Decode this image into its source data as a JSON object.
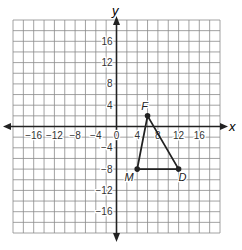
{
  "graph": {
    "x_axis_label": "x",
    "y_axis_label": "y",
    "x_range": [
      -20,
      20
    ],
    "y_range": [
      -20,
      20
    ],
    "grid_step": 2,
    "x_tick_labels": [
      "−16",
      "−12",
      "−8",
      "−4",
      "0",
      "4",
      "8",
      "12",
      "16"
    ],
    "x_tick_values": [
      -16,
      -12,
      -8,
      -4,
      0,
      4,
      8,
      12,
      16
    ],
    "y_tick_labels": [
      "16",
      "12",
      "8",
      "4",
      "−4",
      "−8",
      "−12",
      "−16"
    ],
    "y_tick_values": [
      16,
      12,
      8,
      4,
      -4,
      -8,
      -12,
      -16
    ],
    "colors": {
      "grid": "#8a8a8a",
      "axis": "#222222",
      "shape": "#222222",
      "text": "#333333"
    }
  },
  "triangle": {
    "vertices": [
      {
        "label": "F",
        "x": 6,
        "y": 2
      },
      {
        "label": "M",
        "x": 4,
        "y": -8
      },
      {
        "label": "D",
        "x": 12,
        "y": -8
      }
    ]
  },
  "chart_data": {
    "type": "scatter",
    "title": "",
    "xlabel": "x",
    "ylabel": "y",
    "xlim": [
      -20,
      20
    ],
    "ylim": [
      -20,
      20
    ],
    "grid": true,
    "grid_step": 2,
    "x_ticks": [
      -16,
      -12,
      -8,
      -4,
      0,
      4,
      8,
      12,
      16
    ],
    "y_ticks": [
      -16,
      -12,
      -8,
      -4,
      4,
      8,
      12,
      16
    ],
    "series": [
      {
        "name": "Triangle FMD",
        "closed_polygon": true,
        "points": [
          {
            "label": "F",
            "x": 6,
            "y": 2
          },
          {
            "label": "M",
            "x": 4,
            "y": -8
          },
          {
            "label": "D",
            "x": 12,
            "y": -8
          }
        ]
      }
    ]
  }
}
